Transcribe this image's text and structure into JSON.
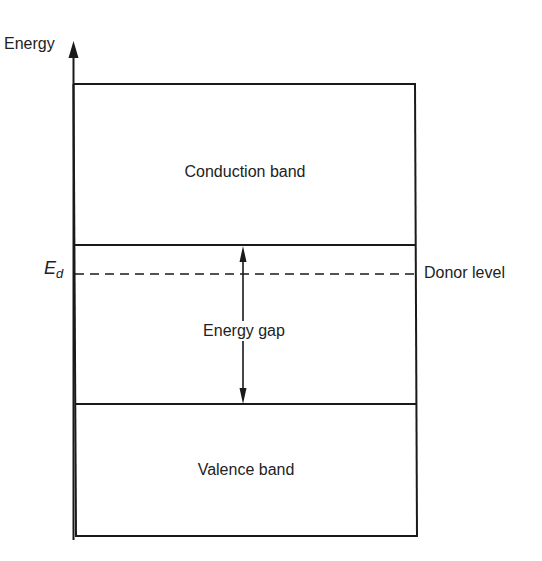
{
  "diagram": {
    "type": "energy band diagram",
    "axis": {
      "label": "Energy",
      "direction": "up"
    },
    "bands": [
      {
        "id": "conduction",
        "label": "Conduction band",
        "top_y": 84,
        "bottom_y": 245
      },
      {
        "id": "gap",
        "label": "Energy gap",
        "top_y": 245,
        "bottom_y": 404
      },
      {
        "id": "valence",
        "label": "Valence band",
        "top_y": 404,
        "bottom_y": 536
      }
    ],
    "donor_level": {
      "symbol": "E",
      "subscript": "d",
      "label": "Donor level",
      "line_style": "dashed",
      "y": 274
    },
    "gap_arrow": {
      "style": "double-headed",
      "x": 243
    },
    "colors": {
      "line": "#1a1a1a",
      "text": "#222222",
      "background": "#ffffff"
    }
  }
}
